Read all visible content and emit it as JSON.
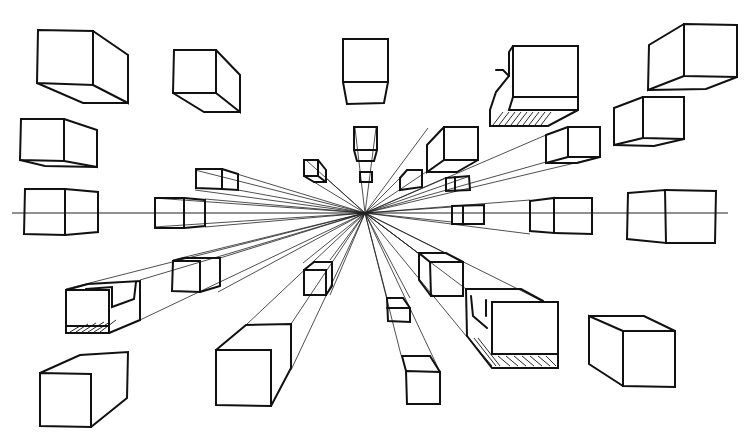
{
  "drawing": {
    "title": "One-point perspective box sketch",
    "width": 756,
    "height": 441,
    "stroke_color": "#111111",
    "background": "#ffffff",
    "vanishing_point": [
      365,
      213
    ],
    "horizon_y": 213,
    "horizon_x_range": [
      12,
      728
    ],
    "boxes": [
      {
        "id": "top-left-large",
        "front": [
          38,
          30,
          92,
          56
        ],
        "side_to": [
          128,
          54,
          128,
          103
        ]
      },
      {
        "id": "top-left-mid",
        "front": [
          173,
          50,
          43,
          43
        ],
        "side_to": [
          241,
          77,
          241,
          113
        ]
      },
      {
        "id": "top-center",
        "front": [
          343,
          40,
          44,
          43
        ],
        "side_to": null
      },
      {
        "id": "top-right-box-shaded",
        "front": [
          513,
          46,
          65,
          53
        ],
        "shaded": true
      },
      {
        "id": "top-right-large",
        "front": [
          684,
          24,
          76,
          53
        ]
      },
      {
        "id": "left-mid",
        "front": [
          21,
          119,
          43,
          42
        ]
      },
      {
        "id": "right-mid",
        "front": [
          643,
          97,
          42,
          42
        ]
      },
      {
        "id": "horizon-left",
        "front": [
          25,
          189,
          40,
          42
        ]
      },
      {
        "id": "horizon-right-large",
        "front": [
          628,
          188,
          89,
          53
        ]
      },
      {
        "id": "bottom-left-shaded",
        "front": [
          66,
          289,
          43,
          43
        ],
        "shaded": true
      },
      {
        "id": "bottom-left-large",
        "front": [
          40,
          373,
          51,
          53
        ]
      },
      {
        "id": "bottom-center-large",
        "front": [
          216,
          350,
          55,
          55
        ]
      },
      {
        "id": "bottom-right-shaded",
        "front": [
          492,
          302,
          66,
          52
        ],
        "shaded": true
      },
      {
        "id": "bottom-right-large",
        "front": [
          622,
          331,
          50,
          56
        ]
      }
    ]
  }
}
